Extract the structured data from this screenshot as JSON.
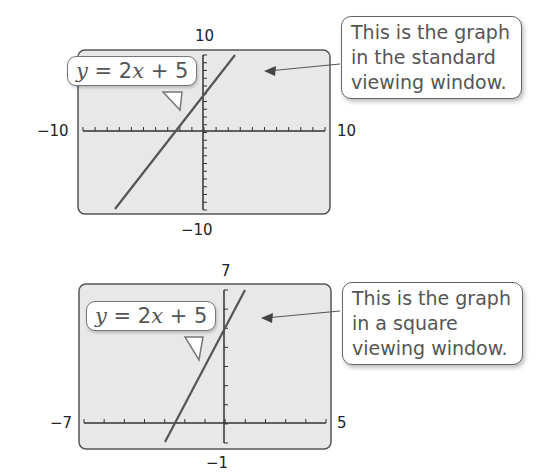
{
  "graphs": [
    {
      "name": "standard-window",
      "equation": {
        "y": "y",
        "eq": " = 2",
        "x": "x",
        "rest": " + 5"
      },
      "callout": "This is the graph\nin the standard\nviewing window.",
      "labels": {
        "ymax": "10",
        "ymin": "−10",
        "xmin": "−10",
        "xmax": "10"
      }
    },
    {
      "name": "square-window",
      "equation": {
        "y": "y",
        "eq": " = 2",
        "x": "x",
        "rest": " + 5"
      },
      "callout": "This is the graph\nin a square\nviewing window.",
      "labels": {
        "ymax": "7",
        "ymin": "−1",
        "xmin": "−7",
        "xmax": "5"
      }
    }
  ],
  "chart_data": [
    {
      "type": "line",
      "title": "y = 2x + 5 (standard viewing window)",
      "x": [
        -10,
        10
      ],
      "series": [
        {
          "name": "y = 2x + 5",
          "slope": 2,
          "intercept": 5,
          "x": [
            -7.5,
            2.5
          ],
          "y": [
            -10,
            10
          ]
        }
      ],
      "xlim": [
        -10,
        10
      ],
      "ylim": [
        -10,
        10
      ],
      "xscale": 1,
      "yscale": 1,
      "annotation": "This is the graph in the standard viewing window."
    },
    {
      "type": "line",
      "title": "y = 2x + 5 (square viewing window)",
      "x": [
        -7,
        5
      ],
      "series": [
        {
          "name": "y = 2x + 5",
          "slope": 2,
          "intercept": 5,
          "x": [
            -3,
            1
          ],
          "y": [
            -1,
            7
          ]
        }
      ],
      "xlim": [
        -7,
        5
      ],
      "ylim": [
        -1,
        7
      ],
      "xscale": 1,
      "yscale": 1,
      "annotation": "This is the graph in a square viewing window."
    }
  ]
}
